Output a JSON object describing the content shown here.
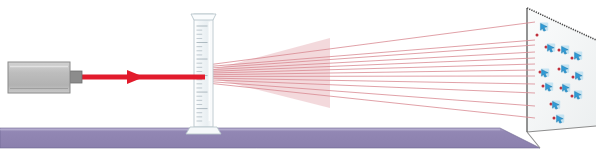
{
  "figure": {
    "title": "Laser diffraction through a graduated cylinder onto a screen",
    "width": 603,
    "height": 153,
    "background_color": "#ffffff"
  },
  "colors": {
    "background": "#ffffff",
    "table_top": "#9287b4",
    "table_face": "#8b80ad",
    "table_highlight": "#aca2c6",
    "table_edge": "#6d6490",
    "laser_body_fill": "#bdbdbd",
    "laser_body_light": "#d2d2d2",
    "laser_body_stroke": "#8a8a8a",
    "laser_nozzle": "#8c8c8c",
    "beam_red": "#e21b2c",
    "ray_red": "#d98a92",
    "dot_red": "#c0303c",
    "cylinder_glass": "#f2f6f8",
    "cylinder_stroke": "#b9c6cc",
    "cylinder_tick": "#9aa8b0",
    "screen_fill": "#f1f4f3",
    "screen_stroke": "#555555",
    "screen_shadow": "#d8dcda",
    "marker_blue": "#2f9bd6",
    "marker_blue_light": "#9fd6ef"
  },
  "laser": {
    "label": "Laser source",
    "body": {
      "x": 8,
      "y": 62,
      "width": 62,
      "height": 31
    },
    "nozzle": {
      "x": 70,
      "y": 71,
      "width": 12,
      "height": 12
    }
  },
  "beam": {
    "label": "Incident laser beam",
    "start_x": 82,
    "end_x": 205,
    "y": 77,
    "thickness": 5,
    "arrow": {
      "x": 136,
      "y": 77,
      "size": 9
    }
  },
  "cylinder": {
    "label": "Graduated cylinder",
    "x": 194,
    "y": 14,
    "width": 19,
    "height": 113,
    "lip_width": 25,
    "base": {
      "x": 186,
      "y": 127,
      "width": 35,
      "height": 7
    },
    "tick_count": 24,
    "tick_long_every": 4
  },
  "rays": {
    "label": "Diffracted rays",
    "origin": {
      "x": 207,
      "y": 74
    },
    "count": 12,
    "end_y": [
      22,
      40,
      45,
      52,
      58,
      64,
      70,
      76,
      84,
      93,
      106,
      118
    ],
    "end_x": 535,
    "spread_half_height": 9
  },
  "screen": {
    "label": "Observation screen",
    "front_edge": {
      "x": 527,
      "y_top": 8,
      "y_bottom": 132
    },
    "top_right": {
      "x": 596,
      "y": 40
    },
    "bottom_right": {
      "x": 596,
      "y": 126
    },
    "fill": "#f1f4f3"
  },
  "table": {
    "label": "Lab table",
    "top_y": 128,
    "bottom_y": 148,
    "left_x": 0,
    "right_x": 500,
    "corner_x": 540,
    "corner_y": 148
  },
  "markers": {
    "label": "Diffraction spots on screen",
    "glyph": "arrow-marker-icon",
    "points": [
      {
        "x": 544,
        "y": 27,
        "dot_x": 537,
        "dot_y": 35
      },
      {
        "x": 551,
        "y": 48,
        "dot_x": 546,
        "dot_y": 47
      },
      {
        "x": 565,
        "y": 50,
        "dot_x": 559,
        "dot_y": 50
      },
      {
        "x": 578,
        "y": 56,
        "dot_x": 572,
        "dot_y": 58
      },
      {
        "x": 565,
        "y": 69,
        "dot_x": 559,
        "dot_y": 69
      },
      {
        "x": 545,
        "y": 73,
        "dot_x": 540,
        "dot_y": 72
      },
      {
        "x": 579,
        "y": 76,
        "dot_x": 573,
        "dot_y": 77
      },
      {
        "x": 549,
        "y": 87,
        "dot_x": 543,
        "dot_y": 86
      },
      {
        "x": 566,
        "y": 88,
        "dot_x": 561,
        "dot_y": 88
      },
      {
        "x": 578,
        "y": 95,
        "dot_x": 572,
        "dot_y": 96
      },
      {
        "x": 556,
        "y": 105,
        "dot_x": 551,
        "dot_y": 104
      },
      {
        "x": 560,
        "y": 119,
        "dot_x": 554,
        "dot_y": 118
      }
    ]
  }
}
